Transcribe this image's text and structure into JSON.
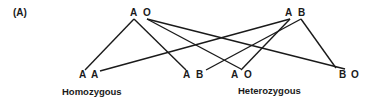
{
  "panel_label": "(A)",
  "parents": {
    "left": {
      "allele1": "A",
      "allele2": "O"
    },
    "right": {
      "allele1": "A",
      "allele2": "B"
    }
  },
  "offspring": [
    {
      "allele1": "A",
      "allele2": "A"
    },
    {
      "allele1": "A",
      "allele2": "B"
    },
    {
      "allele1": "A",
      "allele2": "O"
    },
    {
      "allele1": "B",
      "allele2": "O"
    }
  ],
  "labels": {
    "homozygous": "Homozygous",
    "heterozygous": "Heterozygous"
  }
}
